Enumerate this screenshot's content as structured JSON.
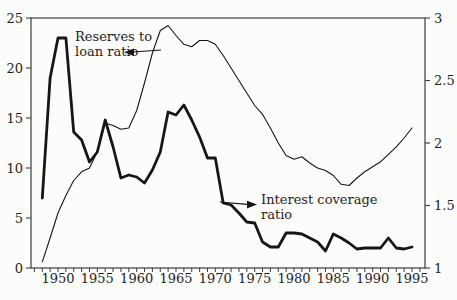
{
  "figure": {
    "background": "#fcfcfa",
    "ink_color": "#161616",
    "frame_color": "#3c3c3c",
    "title": ""
  },
  "chart_data": {
    "type": "line",
    "title": "",
    "xlabel": "",
    "ylabel_left": "",
    "ylabel_right": "",
    "grid": "off",
    "legend_position": "none (inline text annotations with arrows)",
    "x": [
      1948,
      1949,
      1950,
      1951,
      1952,
      1953,
      1954,
      1955,
      1956,
      1957,
      1958,
      1959,
      1960,
      1961,
      1962,
      1963,
      1964,
      1965,
      1966,
      1967,
      1968,
      1969,
      1970,
      1971,
      1972,
      1973,
      1974,
      1975,
      1976,
      1977,
      1978,
      1979,
      1980,
      1981,
      1982,
      1983,
      1984,
      1985,
      1986,
      1987,
      1988,
      1989,
      1990,
      1991,
      1992,
      1993,
      1994,
      1995
    ],
    "x_tick_labels": [
      "1950",
      "1955",
      "1960",
      "1965",
      "1970",
      "1975",
      "1980",
      "1985",
      "1990",
      "1995"
    ],
    "x_tick_label_years": [
      1950,
      1955,
      1960,
      1965,
      1970,
      1975,
      1980,
      1985,
      1990,
      1995
    ],
    "x_minor_ticks_every_year_from": 1947,
    "x_minor_ticks_every_year_to": 1996,
    "axes": {
      "left": {
        "range": [
          0,
          25
        ],
        "ticks": [
          0,
          5,
          10,
          15,
          20,
          25
        ],
        "tick_labels": [
          "0",
          "5",
          "10",
          "15",
          "20",
          "25"
        ]
      },
      "right": {
        "range": [
          1,
          3
        ],
        "ticks": [
          1,
          1.5,
          2,
          2.5,
          3
        ],
        "tick_labels": [
          "1",
          "1.5",
          "2",
          "2.5",
          "3"
        ]
      }
    },
    "series": [
      {
        "name": "Interest coverage ratio",
        "axis": "left",
        "style": "thick",
        "values": [
          7.0,
          19.0,
          23.0,
          23.0,
          13.6,
          12.8,
          10.6,
          11.6,
          14.8,
          12.1,
          9.0,
          9.3,
          9.1,
          8.5,
          9.8,
          11.6,
          15.6,
          15.3,
          16.3,
          14.8,
          13.1,
          11.0,
          11.0,
          6.5,
          6.3,
          5.5,
          4.6,
          4.5,
          2.6,
          2.1,
          2.1,
          3.5,
          3.5,
          3.4,
          3.0,
          2.6,
          1.7,
          3.4,
          3.0,
          2.5,
          1.9,
          2.0,
          2.0,
          2.0,
          3.0,
          2.0,
          1.9,
          2.1
        ]
      },
      {
        "name": "Reserves to loan ratio",
        "axis": "right",
        "style": "thin",
        "values": [
          1.05,
          1.24,
          1.44,
          1.58,
          1.7,
          1.77,
          1.8,
          1.93,
          2.16,
          2.14,
          2.11,
          2.12,
          2.26,
          2.48,
          2.72,
          2.9,
          2.94,
          2.86,
          2.79,
          2.77,
          2.82,
          2.82,
          2.79,
          2.7,
          2.6,
          2.5,
          2.4,
          2.3,
          2.23,
          2.12,
          2.0,
          1.9,
          1.87,
          1.89,
          1.84,
          1.8,
          1.78,
          1.74,
          1.67,
          1.66,
          1.72,
          1.77,
          1.81,
          1.85,
          1.91,
          1.97,
          2.04,
          2.12
        ]
      }
    ],
    "annotations": [
      {
        "lines": [
          "Reserves to",
          "loan ratio"
        ],
        "labels_series": "Reserves to loan ratio",
        "arrow_points": "left"
      },
      {
        "lines": [
          "Interest coverage",
          "ratio"
        ],
        "labels_series": "Interest coverage ratio",
        "arrow_points": "right"
      }
    ]
  }
}
